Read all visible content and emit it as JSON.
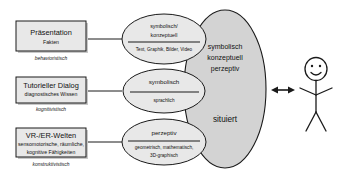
{
  "diagram": {
    "colors": {
      "box_fill": "#e8e8e8",
      "ellipse_small_fill": "#e8e8e8",
      "ellipse_big_fill": "#d3d3d3",
      "stroke": "#1a1a1a",
      "background": "#ffffff"
    },
    "rows": [
      {
        "box": {
          "title": "Präsentation",
          "subtitle": "Fakten",
          "paradigm": "behavioristisch"
        },
        "ellipse": {
          "top_line1": "symbolisch/",
          "top_line2": "konzeptuell",
          "bottom": "Text, Graphik, Bilder, Video"
        }
      },
      {
        "box": {
          "title": "Tutorieller Dialog",
          "subtitle": "diagnostisches Wissen",
          "paradigm": "kognitivistisch"
        },
        "ellipse": {
          "top_line1": "symbolisch",
          "top_line2": "",
          "bottom": "sprachlich"
        }
      },
      {
        "box": {
          "title": "VR-/ER-Welten",
          "subtitle_line1": "sensomotorische, räumliche,",
          "subtitle_line2": "kognitive Fähigkeiten",
          "paradigm": "konstruktivistisch"
        },
        "ellipse": {
          "top_line1": "perzeptiv",
          "top_line2": "",
          "bottom_line1": "geometrisch, mathematisch,",
          "bottom_line2": "3D-graphisch"
        }
      }
    ],
    "main_ellipse": {
      "line1": "symbolisch",
      "line2": "konzeptuell",
      "line3": "perzeptiv",
      "line4": "situiert"
    },
    "actor": {
      "label": "Lernender",
      "arrow": "bidirektionaler Pfeil"
    }
  }
}
